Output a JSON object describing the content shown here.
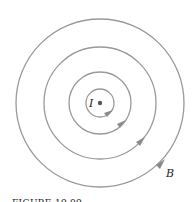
{
  "figure": {
    "caption": "FIGURE 19.09",
    "current_label": "I",
    "field_label": "B",
    "line_color": "#9a9a9a",
    "center": [
      100,
      103
    ],
    "circles": [
      {
        "r": 14,
        "arrow_angle": 40
      },
      {
        "r": 31,
        "arrow_angle": 38
      },
      {
        "r": 56,
        "arrow_angle": 36
      },
      {
        "r": 84,
        "arrow_angle": 34
      }
    ]
  }
}
